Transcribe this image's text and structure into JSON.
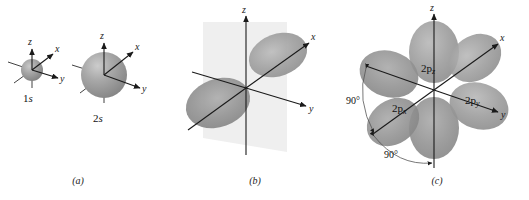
{
  "figure": {
    "background_color": "#ffffff",
    "panels": [
      {
        "id": "a",
        "caption": "(a)",
        "description": "Spherical s orbitals with coordinate axes",
        "orbitals": [
          {
            "label_text": "1s",
            "label_main": "1",
            "label_italic": "s",
            "shape": "sphere",
            "radius_px": 11,
            "center": {
              "x": 32,
              "y": 70
            },
            "axes": [
              "z",
              "x",
              "y"
            ],
            "fill_color": "#9a9a9a"
          },
          {
            "label_text": "2s",
            "label_main": "2",
            "label_italic": "s",
            "shape": "sphere",
            "radius_px": 23,
            "center": {
              "x": 104,
              "y": 75
            },
            "axes": [
              "z",
              "x",
              "y"
            ],
            "fill_color": "#9e9e9e"
          }
        ]
      },
      {
        "id": "b",
        "caption": "(b)",
        "description": "Single 2p orbital with two lobes and a nodal plane",
        "orbitals": [
          {
            "label_text": "",
            "shape": "dumbbell",
            "axes": [
              "z",
              "x",
              "y"
            ],
            "fill_color": "#9a9a9a",
            "nodal_plane_color": "#ececec"
          }
        ]
      },
      {
        "id": "c",
        "caption": "(c)",
        "description": "Three mutually perpendicular 2p orbitals superimposed",
        "orbitals": [
          {
            "label_text": "2pz",
            "label_main": "2p",
            "label_italic": "z",
            "shape": "dumbbell",
            "axis": "z",
            "fill_color": "#9a9a9a"
          },
          {
            "label_text": "2px",
            "label_main": "2p",
            "label_italic": "x",
            "shape": "dumbbell",
            "axis": "x",
            "fill_color": "#9a9a9a"
          },
          {
            "label_text": "2py",
            "label_main": "2p",
            "label_italic": "y",
            "shape": "dumbbell",
            "axis": "y",
            "fill_color": "#9a9a9a"
          }
        ],
        "angles": [
          {
            "value": "90°",
            "position": "upper-left"
          },
          {
            "value": "90°",
            "position": "lower-left"
          }
        ],
        "axes": [
          "z",
          "x",
          "y"
        ]
      }
    ],
    "axis_labels": {
      "z": "z",
      "x": "x",
      "y": "y"
    },
    "colors": {
      "orbital_gray": "#9a9a9a",
      "orbital_dark": "#8a8a8a",
      "orbital_light": "#b8b8b8",
      "plane": "#ececec",
      "ink": "#1a1a1a"
    }
  }
}
